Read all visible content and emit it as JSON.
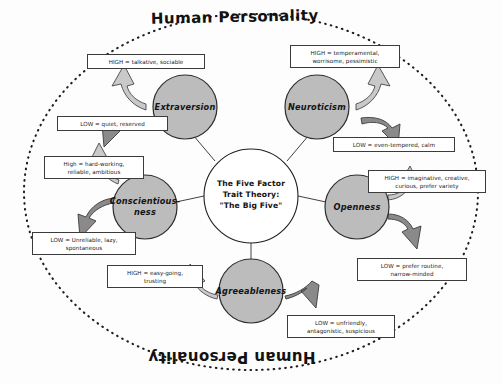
{
  "diagram": {
    "outer_ring": {
      "title_top": "Human Personality",
      "title_bottom": "Human Personality",
      "border_style": "dotted-ellipse"
    },
    "center": {
      "line1": "The Five Factor",
      "line2": "Trait Theory:",
      "line3": "\"The Big Five\"",
      "fill": "#ffffff"
    },
    "colors": {
      "trait_circle_fill": "#bcbcbc",
      "trait_circle_stroke": "#2e2e2e",
      "box_border": "#3b3b3b",
      "arrow_high_fill": "#c9c9c9",
      "arrow_low_fill": "#8f8f8f",
      "text": "#141414",
      "background": "#fdfdfd"
    },
    "traits": [
      {
        "name": "Extraversion",
        "high": "HIGH = talkative, sociable",
        "low": "LOW = quiet, reserved"
      },
      {
        "name": "Neuroticism",
        "high": "HIGH = temperamental, worrisome, pessimistic",
        "low": "LOW = even-tempered, calm"
      },
      {
        "name": "Openness",
        "high": "HIGH = imaginative, creative, curious, prefer variety",
        "low": "LOW = prefer routine, narrow-minded"
      },
      {
        "name": "Agreeableness",
        "high": "HIGH = easy-going, trusting",
        "low": "LOW = unfriendly, antagonistic, suspicious"
      },
      {
        "name": "Conscientious-­ness",
        "name_line1": "Conscientious-",
        "name_line2": "ness",
        "high": "High = hard-working, reliable, ambitious",
        "low": "LOW = Unreliable, lazy, spontaneous"
      }
    ],
    "boxes": {
      "extraversion_high_l1": "HIGH = talkative, sociable",
      "extraversion_low_l1": "LOW = quiet, reserved",
      "neuroticism_high_l1": "HIGH = temperamental,",
      "neuroticism_high_l2": "worrisome, pessimistic",
      "neuroticism_low_l1": "LOW = even-tempered, calm",
      "openness_high_l1": "HIGH = imaginative, creative,",
      "openness_high_l2": "curious, prefer variety",
      "openness_low_l1": "LOW = prefer routine,",
      "openness_low_l2": "narrow-minded",
      "agreeableness_high_l1": "HIGH = easy-going,",
      "agreeableness_high_l2": "trusting",
      "agreeableness_low_l1": "LOW = unfriendly,",
      "agreeableness_low_l2": "antagonistic, suspicious",
      "conscientiousness_high_l1": "High = hard-working,",
      "conscientiousness_high_l2": "reliable, ambitious",
      "conscientiousness_low_l1": "LOW = Unreliable, lazy,",
      "conscientiousness_low_l2": "spontaneous"
    }
  }
}
